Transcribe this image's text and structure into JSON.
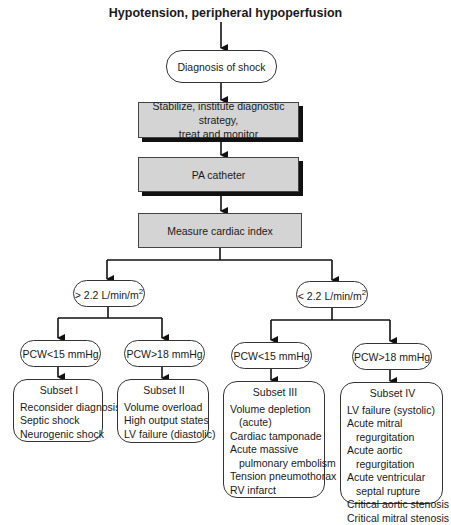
{
  "title": "Hypotension, peripheral hypoperfusion",
  "nodes": {
    "diagnosis": "Diagnosis of shock",
    "stabilize_line1": "Stabilize, institute diagnostic strategy,",
    "stabilize_line2": "treat and monitor",
    "pa_catheter": "PA catheter",
    "measure": "Measure cardiac index",
    "ci_high": "> 2.2 L/min/m",
    "ci_low": "< 2.2 L/min/m",
    "ci_exp": "2",
    "pcw_low_left": "PCW<15 mmHg",
    "pcw_high_left": "PCW>18 mmHg",
    "pcw_low_right": "PCW<15 mmHg",
    "pcw_high_right": "PCW>18 mmHg"
  },
  "subsets": [
    {
      "title": "Subset I",
      "items": [
        {
          "text": "Reconsider diagnosis",
          "indent": false
        },
        {
          "text": "Septic shock",
          "indent": false
        },
        {
          "text": "Neurogenic shock",
          "indent": false
        }
      ]
    },
    {
      "title": "Subset II",
      "items": [
        {
          "text": "Volume overload",
          "indent": false
        },
        {
          "text": "High output states",
          "indent": false
        },
        {
          "text": "LV failure (diastolic)",
          "indent": false
        }
      ]
    },
    {
      "title": "Subset III",
      "items": [
        {
          "text": "Volume depletion",
          "indent": false
        },
        {
          "text": "(acute)",
          "indent": true
        },
        {
          "text": "Cardiac tamponade",
          "indent": false
        },
        {
          "text": "Acute massive",
          "indent": false
        },
        {
          "text": "pulmonary embolism",
          "indent": true
        },
        {
          "text": "Tension pneumothorax",
          "indent": false
        },
        {
          "text": "RV infarct",
          "indent": false
        }
      ]
    },
    {
      "title": "Subset IV",
      "items": [
        {
          "text": "LV failure (systolic)",
          "indent": false
        },
        {
          "text": "Acute mitral",
          "indent": false
        },
        {
          "text": "regurgitation",
          "indent": true
        },
        {
          "text": "Acute aortic",
          "indent": false
        },
        {
          "text": "regurgitation",
          "indent": true
        },
        {
          "text": "Acute ventricular",
          "indent": false
        },
        {
          "text": "septal rupture",
          "indent": true
        },
        {
          "text": "Critical aortic stenosis",
          "indent": false
        },
        {
          "text": "Critical mitral stenosis",
          "indent": false
        }
      ]
    }
  ],
  "colors": {
    "box_fill": "#d4d4d4",
    "shadow": "#111111",
    "line": "#111111"
  }
}
